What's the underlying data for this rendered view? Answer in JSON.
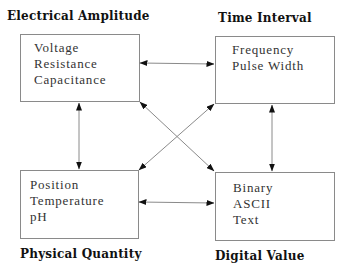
{
  "diagram": {
    "nodes": [
      {
        "id": "electrical",
        "title": "Electrical Amplitude",
        "items": [
          "Voltage",
          "Resistance",
          "Capacitance"
        ]
      },
      {
        "id": "time",
        "title": "Time Interval",
        "items": [
          "Frequency",
          "Pulse Width"
        ]
      },
      {
        "id": "physical",
        "title": "Physical Quantity",
        "items": [
          "Position",
          "Temperature",
          "pH"
        ]
      },
      {
        "id": "digital",
        "title": "Digital Value",
        "items": [
          "Binary",
          "ASCII",
          "Text"
        ]
      }
    ],
    "edges": [
      {
        "from": "electrical",
        "to": "time",
        "bidirectional": true
      },
      {
        "from": "physical",
        "to": "digital",
        "bidirectional": true
      },
      {
        "from": "electrical",
        "to": "physical",
        "bidirectional": true
      },
      {
        "from": "time",
        "to": "digital",
        "bidirectional": true
      },
      {
        "from": "electrical",
        "to": "digital",
        "bidirectional": true
      },
      {
        "from": "time",
        "to": "physical",
        "bidirectional": true
      }
    ],
    "colors": {
      "line": "#8a8a8a",
      "arrowhead": "#111111",
      "text": "#333333"
    }
  }
}
